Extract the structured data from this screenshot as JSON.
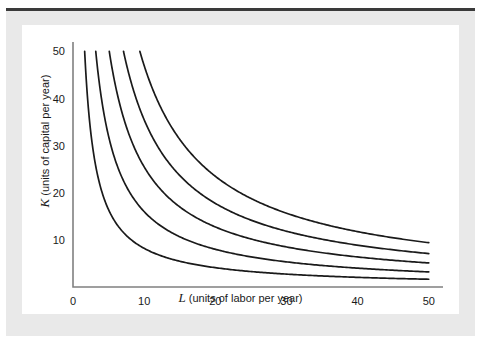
{
  "figure": {
    "panel_bg": "#ffffff",
    "page_bg": "#e9e9e9",
    "rule_color": "#3a3a3a",
    "axis_color": "#808080",
    "curve_color": "#1a1a1a"
  },
  "chart_data": {
    "type": "line",
    "title": "",
    "subtitle": "",
    "xlabel_var": "L",
    "xlabel_rest": " (units of labor per year)",
    "ylabel_var": "K",
    "ylabel_rest": " (units of capital per year)",
    "xlim": [
      0,
      52
    ],
    "ylim": [
      0,
      52
    ],
    "xticks": [
      0,
      10,
      20,
      30,
      40,
      50
    ],
    "xtick_labels": [
      "0",
      "10",
      "20",
      "30",
      "40",
      "50"
    ],
    "yticks": [
      10,
      20,
      30,
      40,
      50
    ],
    "ytick_labels": [
      "10",
      "20",
      "30",
      "40",
      "50"
    ],
    "grid": false,
    "legend": "none",
    "annotations": [],
    "series": [
      {
        "name": "isoquant-1",
        "constant": 82,
        "x": [
          1.64,
          2,
          3,
          4,
          5,
          6,
          7,
          8,
          9,
          10,
          12,
          14,
          16,
          18,
          20,
          24,
          28,
          32,
          36,
          40,
          44,
          48,
          50
        ],
        "y": [
          50,
          41,
          27.3,
          20.5,
          16.4,
          13.7,
          11.7,
          10.3,
          9.1,
          8.2,
          6.8,
          5.9,
          5.1,
          4.6,
          4.1,
          3.4,
          2.9,
          2.6,
          2.3,
          2.1,
          1.9,
          1.7,
          1.6
        ]
      },
      {
        "name": "isoquant-2",
        "constant": 160,
        "x": [
          3.2,
          4,
          5,
          6,
          7,
          8,
          9,
          10,
          12,
          14,
          16,
          18,
          20,
          24,
          28,
          32,
          36,
          40,
          44,
          48,
          50
        ],
        "y": [
          50,
          40,
          32,
          26.7,
          22.9,
          20,
          17.8,
          16,
          13.3,
          11.4,
          10,
          8.9,
          8,
          6.7,
          5.7,
          5,
          4.4,
          4,
          3.6,
          3.3,
          3.2
        ]
      },
      {
        "name": "isoquant-3",
        "constant": 255,
        "x": [
          5.1,
          6,
          7,
          8,
          9,
          10,
          12,
          14,
          16,
          18,
          20,
          24,
          28,
          32,
          36,
          40,
          44,
          48,
          50
        ],
        "y": [
          50,
          42.5,
          36.4,
          31.9,
          28.3,
          25.5,
          21.3,
          18.2,
          15.9,
          14.2,
          12.8,
          10.6,
          9.1,
          8,
          7.1,
          6.4,
          5.8,
          5.3,
          5.1
        ]
      },
      {
        "name": "isoquant-4",
        "constant": 355,
        "x": [
          7.1,
          8,
          9,
          10,
          12,
          14,
          16,
          18,
          20,
          24,
          28,
          32,
          36,
          40,
          44,
          48,
          50
        ],
        "y": [
          50,
          44.4,
          39.4,
          35.5,
          29.6,
          25.4,
          22.2,
          19.7,
          17.8,
          14.8,
          12.7,
          11.1,
          9.9,
          8.9,
          8.1,
          7.4,
          7.1
        ]
      },
      {
        "name": "isoquant-5",
        "constant": 470,
        "x": [
          9.4,
          10,
          12,
          14,
          16,
          18,
          20,
          24,
          28,
          32,
          36,
          40,
          44,
          48,
          50
        ],
        "y": [
          50,
          47,
          39.2,
          33.6,
          29.4,
          26.1,
          23.5,
          19.6,
          16.8,
          14.7,
          13.1,
          11.8,
          10.7,
          9.8,
          9.4
        ]
      }
    ]
  }
}
